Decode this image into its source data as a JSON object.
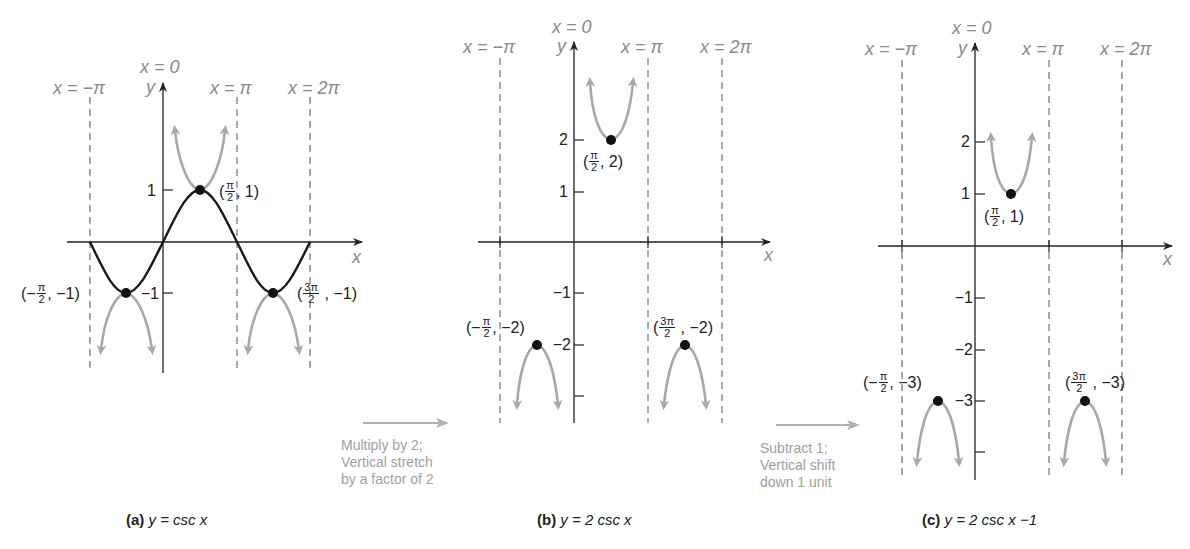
{
  "panels": [
    {
      "id": "a",
      "caption_tag": "(a)",
      "caption_eq": "y = csc x",
      "asymptote_labels": [
        "x = −π",
        "x = 0",
        "x = π",
        "x = 2π"
      ],
      "y_axis_label": "y",
      "x_axis_label": "x",
      "y_ticks": [
        "1",
        "−1"
      ],
      "points": [
        {
          "num": "π",
          "den": "2",
          "prefix": "(",
          "sign": "",
          "y": "1)"
        },
        {
          "num": "π",
          "den": "2",
          "prefix": "(−",
          "sign": "",
          "y": "−1)"
        },
        {
          "num": "3π",
          "den": "2",
          "prefix": "(",
          "sign": "",
          "y": "−1)"
        }
      ]
    },
    {
      "id": "b",
      "caption_tag": "(b)",
      "caption_eq": "y = 2 csc x",
      "asymptote_labels": [
        "x = −π",
        "x = 0",
        "x = π",
        "x = 2π"
      ],
      "y_axis_label": "y",
      "x_axis_label": "x",
      "y_ticks": [
        "2",
        "1",
        "−1",
        "−2"
      ],
      "points": [
        {
          "num": "π",
          "den": "2",
          "prefix": "(",
          "y": "2)"
        },
        {
          "num": "π",
          "den": "2",
          "prefix": "(−",
          "y": "−2)"
        },
        {
          "num": "3π",
          "den": "2",
          "prefix": "(",
          "y": "−2)"
        }
      ]
    },
    {
      "id": "c",
      "caption_tag": "(c)",
      "caption_eq": "y = 2 csc x −1",
      "asymptote_labels": [
        "x = −π",
        "x = 0",
        "x = π",
        "x = 2π"
      ],
      "y_axis_label": "y",
      "x_axis_label": "x",
      "y_ticks": [
        "2",
        "1",
        "−1",
        "−2",
        "−3"
      ],
      "points": [
        {
          "num": "π",
          "den": "2",
          "prefix": "(",
          "y": "1)"
        },
        {
          "num": "π",
          "den": "2",
          "prefix": "(−",
          "y": "−3)"
        },
        {
          "num": "3π",
          "den": "2",
          "prefix": "(",
          "y": "−3)"
        }
      ]
    }
  ],
  "transforms": [
    {
      "lines": [
        "Multiply by 2;",
        "Vertical stretch",
        "by a factor of 2"
      ]
    },
    {
      "lines": [
        "Subtract 1;",
        "Vertical shift",
        "down 1 unit"
      ]
    }
  ],
  "colors": {
    "curve": "#1a1a1a",
    "csc_branch": "#a8a8a8",
    "asymptote": "#555555",
    "label_gray": "#8a8a8a",
    "note_gray": "#a0a0a0"
  }
}
